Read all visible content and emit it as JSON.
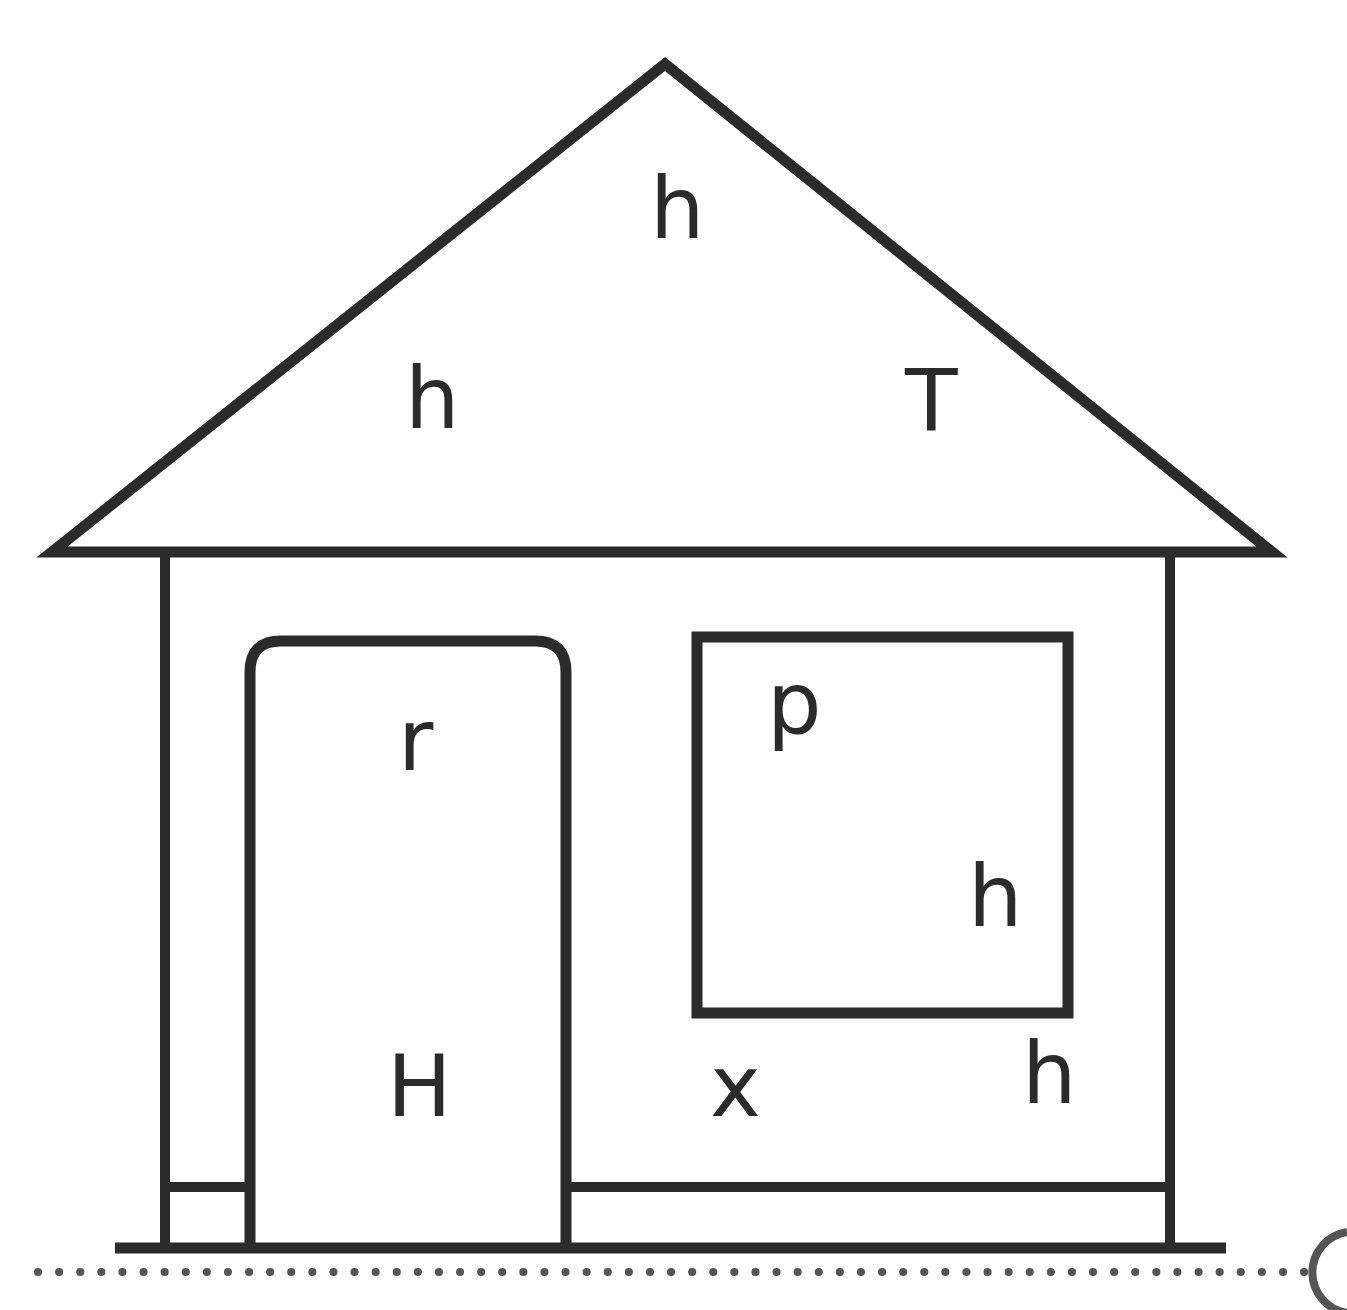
{
  "figure": {
    "background_color": "#ffffff",
    "stroke_color": "#2b2b2b",
    "text_color": "#2b2b2b"
  },
  "labels": {
    "roof_top": "h",
    "roof_left": "h",
    "roof_right": "T",
    "door_top": "r",
    "door_bottom": "H",
    "window_top": "p",
    "window_bottom": "h",
    "wall_left_bottom": "x",
    "wall_right_bottom": "h"
  },
  "shapes": {
    "roof": "triangle",
    "walls": "rectangle-outline",
    "door": "rounded-rectangle",
    "window": "rectangle-outline",
    "baseboard": "horizontal-line",
    "ground": "horizontal-line",
    "ground_dotted": "dotted-line",
    "corner_arc": "circle-arc"
  }
}
